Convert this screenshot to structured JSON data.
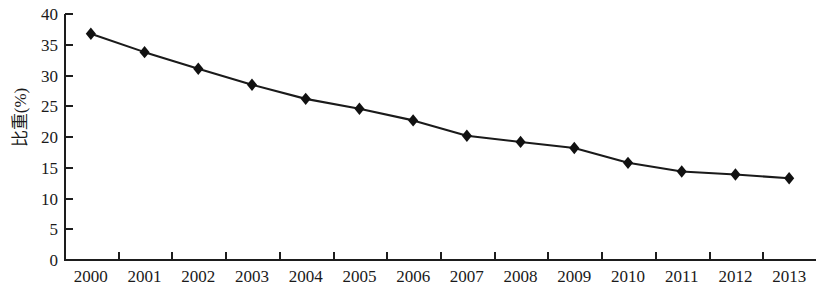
{
  "chart_data": {
    "type": "line",
    "title": "",
    "xlabel": "",
    "ylabel": "比重(%)",
    "categories": [
      "2000",
      "2001",
      "2002",
      "2003",
      "2004",
      "2005",
      "2006",
      "2007",
      "2008",
      "2009",
      "2010",
      "2011",
      "2012",
      "2013"
    ],
    "values": [
      36.8,
      33.8,
      31.1,
      28.5,
      26.2,
      24.6,
      22.7,
      20.2,
      19.2,
      18.2,
      15.8,
      14.4,
      13.9,
      13.3
    ],
    "series": [
      {
        "name": "比重(%)",
        "values": [
          36.8,
          33.8,
          31.1,
          28.5,
          26.2,
          24.6,
          22.7,
          20.2,
          19.2,
          18.2,
          15.8,
          14.4,
          13.9,
          13.3
        ]
      }
    ],
    "ylim": [
      0,
      40
    ],
    "y_ticks": [
      0,
      5,
      10,
      15,
      20,
      25,
      30,
      35,
      40
    ],
    "y_tick_labels": [
      "0",
      "5",
      "10",
      "15",
      "20",
      "25",
      "30",
      "35",
      "40"
    ],
    "grid": false,
    "legend": false,
    "legend_position": "none",
    "marker": "diamond",
    "line_color": "#1a1a1a",
    "marker_color": "#111111",
    "background_color": "#ffffff"
  }
}
